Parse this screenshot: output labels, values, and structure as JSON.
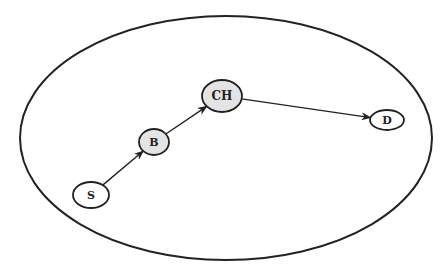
{
  "diagram": {
    "type": "network-path",
    "boundary": "cluster-region",
    "nodes": [
      {
        "id": "S",
        "label": "S",
        "role": "source",
        "fill": "#ffffff"
      },
      {
        "id": "B",
        "label": "B",
        "role": "intermediate",
        "fill": "#e4e4e4"
      },
      {
        "id": "CH",
        "label": "CH",
        "role": "cluster-head",
        "fill": "#e4e4e4"
      },
      {
        "id": "D",
        "label": "D",
        "role": "destination",
        "fill": "#ffffff"
      }
    ],
    "edges": [
      {
        "from": "S",
        "to": "B"
      },
      {
        "from": "B",
        "to": "CH"
      },
      {
        "from": "CH",
        "to": "D"
      }
    ]
  }
}
